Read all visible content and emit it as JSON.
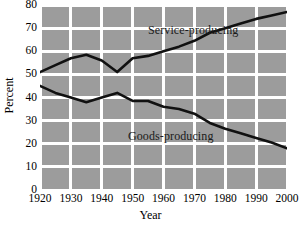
{
  "chart_data": {
    "type": "line",
    "title": "",
    "xlabel": "Year",
    "ylabel": "Percent",
    "xlim": [
      1920,
      2000
    ],
    "ylim": [
      0,
      80
    ],
    "grid": true,
    "legend_position": "inline-annotations",
    "x_ticks": [
      "1920",
      "1930",
      "1940",
      "1950",
      "1960",
      "1970",
      "1980",
      "1990",
      "2000"
    ],
    "y_ticks": [
      "0",
      "10",
      "20",
      "30",
      "40",
      "50",
      "60",
      "70",
      "80"
    ],
    "x": [
      1920,
      1925,
      1930,
      1935,
      1940,
      1945,
      1950,
      1955,
      1960,
      1965,
      1970,
      1975,
      1980,
      1985,
      1990,
      1995,
      2000
    ],
    "series": [
      {
        "name": "Service-producing",
        "color": "#111111",
        "values": [
          51,
          54,
          57,
          58.5,
          56,
          51,
          57,
          58,
          60,
          62,
          64.5,
          68,
          70,
          72,
          74,
          75.5,
          77
        ]
      },
      {
        "name": "Goods-producing",
        "color": "#111111",
        "values": [
          45,
          42,
          40,
          38,
          40,
          42,
          38.5,
          38.5,
          36,
          35,
          33,
          29,
          26.5,
          24.5,
          22.5,
          20.5,
          18
        ]
      }
    ],
    "annotations": [
      {
        "text": "Service-producing",
        "series": "Service-producing"
      },
      {
        "text": "Goods-producing",
        "series": "Goods-producing"
      }
    ],
    "colors": {
      "plot_background": "#9c9c9c",
      "gridline": "#ffffff",
      "line": "#111111",
      "page_background": "#ffffff",
      "text": "#000000"
    }
  }
}
